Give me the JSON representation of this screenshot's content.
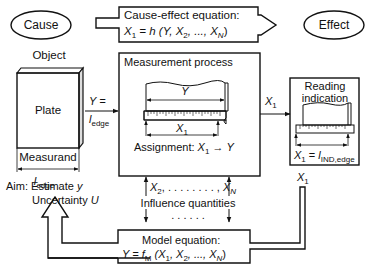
{
  "nodes": {
    "cause": {
      "label": "Cause"
    },
    "effect": {
      "label": "Effect"
    },
    "cause_effect_equation": {
      "title": "Cause-effect equation:",
      "lhs": "X",
      "lhs_sub": "1",
      "rhs": "= h (Y, X",
      "rhs_sub2": "2",
      "rhs_mid": ", ..., X",
      "rhs_subN": "N",
      "rhs_end": ")"
    },
    "object": {
      "heading": "Object",
      "plate_label": "Plate",
      "measurand_label": "Measurand",
      "measurand_symbol": "l",
      "measurand_sub": "edge"
    },
    "input_arrow": {
      "line1": "Y =",
      "line2": "l",
      "line2_sub": "edge"
    },
    "measurement_process": {
      "title": "Measurement process",
      "y_label": "Y",
      "x1_label": "X",
      "x1_sub": "1",
      "assignment_prefix": "Assignment: ",
      "assignment_x": "X",
      "assignment_sub": "1",
      "assignment_arrow": " → ",
      "assignment_y": "Y"
    },
    "output_arrow": {
      "label": "X",
      "label_sub": "1"
    },
    "reading_indication": {
      "title_line1": "Reading",
      "title_line2": "indication",
      "eq_x": "X",
      "eq_sub": "1",
      "eq_mid": " = ",
      "eq_l": "l",
      "eq_l_sub": "IND,edge"
    },
    "influence": {
      "x2": "X",
      "x2_sub": "2",
      "dots": ", . . . . . . . . ,",
      "xn": "X",
      "xn_sub": "N",
      "label": "Influence quantities",
      "dots_below": ". . . . . ."
    },
    "aim": {
      "line1_prefix": "Aim: Estimate ",
      "line1_var": "y",
      "line2_prefix": "Uncertainty ",
      "line2_var": "U"
    },
    "feedback": {
      "label": "X",
      "label_sub": "1"
    },
    "model_equation": {
      "title": "Model equation:",
      "lhs": "Y = f",
      "lhs_sub": "M",
      "mid": " (X",
      "sub1": "1",
      "mid2": ", X",
      "sub2": "2",
      "mid3": ", ..., X",
      "subN": "N",
      "end": ")"
    }
  },
  "colors": {
    "stroke": "#111111",
    "background": "#ffffff"
  }
}
